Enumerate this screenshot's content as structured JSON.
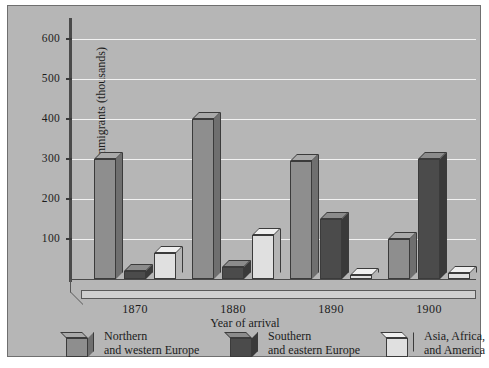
{
  "chart_data": {
    "type": "bar",
    "title": "",
    "xlabel": "Year of arrival",
    "ylabel": "Number of immigrants (thousands)",
    "categories": [
      "1870",
      "1880",
      "1890",
      "1900"
    ],
    "series": [
      {
        "name": "Northern and western Europe",
        "values": [
          300,
          400,
          295,
          100
        ],
        "color": "#8e8e8e"
      },
      {
        "name": "Southern and eastern Europe",
        "values": [
          20,
          30,
          150,
          300
        ],
        "color": "#4b4b4b"
      },
      {
        "name": "Asia, Africa, and America",
        "values": [
          65,
          110,
          10,
          15
        ],
        "color": "#e0e0e0"
      }
    ],
    "ylim": [
      0,
      650
    ],
    "yticks": [
      100,
      200,
      300,
      400,
      500,
      600
    ],
    "ytick_labels": [
      "100",
      "200",
      "300",
      "400",
      "500",
      "600"
    ],
    "grid": true,
    "legend_position": "bottom",
    "style": "3d-bars-grayscale"
  },
  "legend": {
    "items": [
      {
        "line1": "Northern",
        "line2": "and western Europe",
        "swatch": "series-1-swatch"
      },
      {
        "line1": "Southern",
        "line2": "and eastern Europe",
        "swatch": "series-2-swatch"
      },
      {
        "line1": "Asia, Africa,",
        "line2": "and America",
        "swatch": "series-3-swatch"
      }
    ]
  }
}
